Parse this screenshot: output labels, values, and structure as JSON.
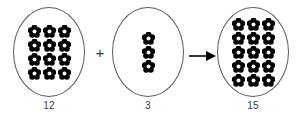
{
  "diagram": {
    "type": "addition-set-model",
    "background_color": "#ffffff",
    "outline_color": "#5a5a5a",
    "token_color": "#000000",
    "label_color": "#3b3b3b",
    "token_icon": "flower-icon",
    "groups": [
      {
        "id": "addend-1",
        "label": "12",
        "count": 12,
        "rows": 4,
        "columns": 3,
        "token_size": 13
      },
      {
        "id": "addend-2",
        "label": "3",
        "count": 3,
        "rows": 3,
        "columns": 1,
        "token_size": 11
      },
      {
        "id": "sum",
        "label": "15",
        "count": 15,
        "rows": 5,
        "columns": 3,
        "token_size": 13
      }
    ],
    "operators": [
      {
        "id": "plus",
        "symbol": "+",
        "name": "plus-operator"
      },
      {
        "id": "arrow",
        "symbol": "→",
        "name": "right-arrow"
      }
    ],
    "equation": "12 + 3 = 15"
  }
}
